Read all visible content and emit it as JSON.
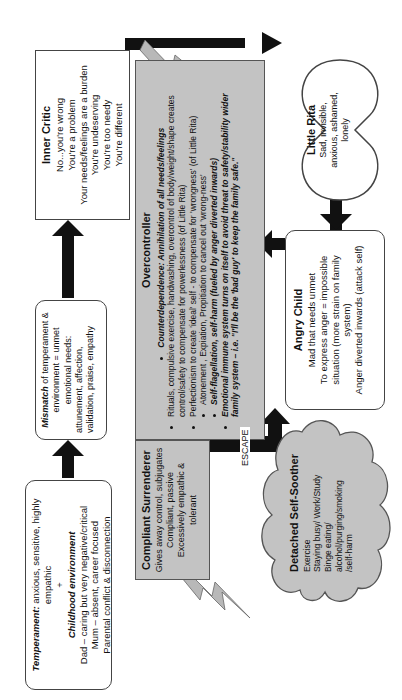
{
  "temperament": {
    "label": "Temperament:",
    "text": " anxious, sensitive, highly empathic",
    "plus": "+",
    "env_title": "Childhood environment",
    "lines": [
      "Dad – caring but very negative/critical",
      "Mum – absent, career focused",
      "Parental conflict & disconnection"
    ]
  },
  "mismatch": {
    "label": "Mismatch",
    "text": " of temperament & environment = unmet emotional needs:",
    "needs": "attunement, affection, validation, praise, empathy"
  },
  "inner_critic": {
    "title": "Inner Critic",
    "lines": [
      "No...you're wrong",
      "You're a problem",
      "Your needs/feelings are a burden",
      "You're undeserving",
      "You're too needy",
      "You're different"
    ]
  },
  "overcontroller": {
    "title": "Overcontroller",
    "bullets": [
      "Counterdependence: Annihilation of all needs/feelings",
      "Rituals, compulsive exercise, handwashing, overcontrol of body/weight/shape creates control/safety to compensate for powerlessness (of Little Rita)",
      "Perfectionism to create 'ideal' self - to compensate for 'wrongness' (of Little Rita)",
      "Atonement , Expiation, Propitiation to cancel out 'wrong-ness'",
      "Self-flagellation, self-harm (fueled by anger diverted inwards)",
      "Emotional immune system turns on itself to avoid threat to safety/stability wider family system – i.e. \"I'll be the 'bad guy' to keep the family safe.\""
    ]
  },
  "compliant_surrenderer": {
    "title": "Compliant Surrenderer",
    "lines": [
      "Gives away control, subjugates",
      "Compliant, passive",
      "Excessively empathic & tolerant"
    ]
  },
  "little_rita": {
    "title": "Little Rita",
    "text": "Sad, invisible, anxious, ashamed, lonely"
  },
  "angry_child": {
    "title": "Angry Child",
    "lines": [
      "Mad that needs unmet",
      "To express anger = impossible situation (more strain on family system)",
      "Anger diverted inwards (attack self)"
    ]
  },
  "detached_self_soother": {
    "title": "Detached Self-Soother",
    "lines": [
      "Exercise",
      "Staying busy/ Work/Study",
      "Binge eating/",
      "alcohol/purging/smoking",
      "/self-harm"
    ]
  },
  "escape_label": "ESCAPE",
  "colors": {
    "gray_fill": "#c3c3c3",
    "arrow": "#111111",
    "outline": "#444444"
  }
}
